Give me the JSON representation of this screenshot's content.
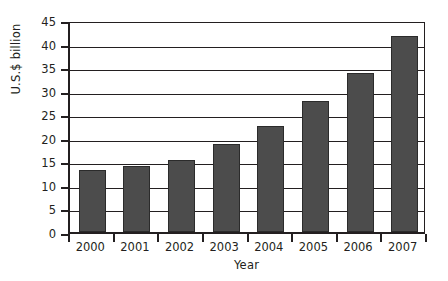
{
  "chart_data": {
    "type": "bar",
    "title": "",
    "subtitle": "",
    "xlabel": "Year",
    "ylabel": "U.S.$ billion",
    "categories": [
      "2000",
      "2001",
      "2002",
      "2003",
      "2004",
      "2005",
      "2006",
      "2007"
    ],
    "values": [
      13.1,
      14.0,
      15.2,
      18.7,
      22.6,
      27.8,
      33.8,
      41.6
    ],
    "ylim": [
      0,
      45
    ],
    "ytick_labels": [
      "45",
      "40",
      "35",
      "30",
      "25",
      "20",
      "15",
      "10",
      "5",
      "0"
    ],
    "ytick_values": [
      45,
      40,
      35,
      30,
      25,
      20,
      15,
      10,
      5,
      0
    ],
    "ytick_step": 5,
    "grid": "horizontal",
    "legend": "none",
    "annotations": [],
    "series": [
      {
        "name": "U.S.$ billion",
        "color": "#4c4c4c",
        "values": [
          13.1,
          14.0,
          15.2,
          18.7,
          22.6,
          27.8,
          33.8,
          41.6
        ]
      }
    ]
  },
  "style": {
    "bar_fill": "#4c4c4c",
    "bar_stroke": "#2b2b2b",
    "axis_color": "#231f20",
    "background": "#ffffff"
  }
}
